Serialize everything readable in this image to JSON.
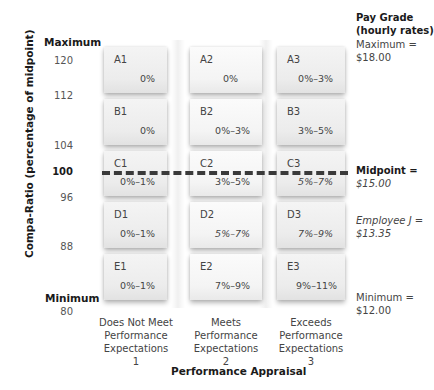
{
  "y_axis": {
    "label": "Compa-Ratio (percentage of midpoint)",
    "max_label": "Maximum",
    "min_label": "Minimum",
    "ticks": [
      "120",
      "112",
      "104",
      "100",
      "96",
      "88",
      "80"
    ]
  },
  "x_axis": {
    "label": "Performance Appraisal",
    "categories": [
      {
        "lines": [
          "Does Not Meet",
          "Performance",
          "Expectations",
          "1"
        ]
      },
      {
        "lines": [
          "Meets",
          "Performance",
          "Expectations",
          "2"
        ]
      },
      {
        "lines": [
          "Exceeds",
          "Performance",
          "Expectations",
          "3"
        ]
      }
    ]
  },
  "grid": {
    "rows": [
      {
        "cells": [
          {
            "code": "A1",
            "value": "0%"
          },
          {
            "code": "A2",
            "value": "0%"
          },
          {
            "code": "A3",
            "value": "0%–3%"
          }
        ]
      },
      {
        "cells": [
          {
            "code": "B1",
            "value": "0%"
          },
          {
            "code": "B2",
            "value": "0%–3%"
          },
          {
            "code": "B3",
            "value": "3%–5%"
          }
        ]
      },
      {
        "cells": [
          {
            "code": "C1",
            "value": "0%–1%"
          },
          {
            "code": "C2",
            "value": "3%–5%"
          },
          {
            "code": "C3",
            "value": "5%–7%"
          }
        ]
      },
      {
        "cells": [
          {
            "code": "D1",
            "value": "0%–1%"
          },
          {
            "code": "D2",
            "value": "5%–7%"
          },
          {
            "code": "D3",
            "value": "7%–9%"
          }
        ]
      },
      {
        "cells": [
          {
            "code": "E1",
            "value": "0%–1%"
          },
          {
            "code": "E2",
            "value": "7%–9%"
          },
          {
            "code": "E3",
            "value": "9%–11%"
          }
        ]
      }
    ]
  },
  "right_panel": {
    "title_line1": "Pay Grade",
    "title_line2": "(hourly rates)",
    "maximum_label": "Maximum =",
    "maximum_value": "$18.00",
    "midpoint_label": "Midpoint =",
    "midpoint_value": "$15.00",
    "employee_label": "Employee J =",
    "employee_value": "$13.35",
    "minimum_label": "Minimum =",
    "minimum_value": "$12.00"
  },
  "midpoint_line": {
    "at": "100",
    "style": "dashed",
    "color": "#3a3a3a"
  }
}
